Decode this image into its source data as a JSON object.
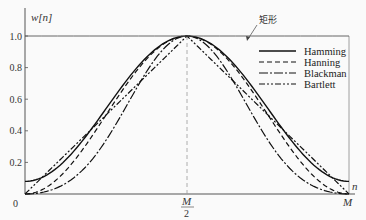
{
  "chart_data": {
    "type": "line",
    "title": "",
    "ylabel": "w[n]",
    "xlabel": "n",
    "ylim": [
      0,
      1.0
    ],
    "xlim": [
      0,
      "M"
    ],
    "yticks": [
      "0.2",
      "0.4",
      "0.6",
      "0.8",
      "1.0"
    ],
    "y_origin_label": "0",
    "xticks": [
      {
        "label_num": "M",
        "label_den": "2",
        "position": 0.5
      },
      {
        "label": "M",
        "position": 1.0
      }
    ],
    "grid": false,
    "legend_position": "upper right",
    "annotation": {
      "text": "矩形",
      "target": "rectangular window (horizontal line at 1.0)"
    },
    "x": [
      0,
      0.05,
      0.1,
      0.15,
      0.2,
      0.25,
      0.3,
      0.35,
      0.4,
      0.45,
      0.5,
      0.55,
      0.6,
      0.65,
      0.7,
      0.75,
      0.8,
      0.85,
      0.9,
      0.95,
      1.0
    ],
    "series": [
      {
        "name": "Hamming",
        "style": "solid",
        "values": [
          0.08,
          0.1,
          0.17,
          0.27,
          0.4,
          0.54,
          0.68,
          0.81,
          0.91,
          0.98,
          1.0,
          0.98,
          0.91,
          0.81,
          0.68,
          0.54,
          0.4,
          0.27,
          0.17,
          0.1,
          0.08
        ]
      },
      {
        "name": "Hanning",
        "style": "dashed",
        "values": [
          0.0,
          0.02,
          0.1,
          0.21,
          0.35,
          0.5,
          0.65,
          0.79,
          0.9,
          0.98,
          1.0,
          0.98,
          0.9,
          0.79,
          0.65,
          0.5,
          0.35,
          0.21,
          0.1,
          0.02,
          0.0
        ]
      },
      {
        "name": "Blackman",
        "style": "dash-dot",
        "values": [
          0.0,
          0.01,
          0.04,
          0.1,
          0.2,
          0.34,
          0.51,
          0.68,
          0.85,
          0.96,
          1.0,
          0.96,
          0.85,
          0.68,
          0.51,
          0.34,
          0.2,
          0.1,
          0.04,
          0.01,
          0.0
        ]
      },
      {
        "name": "Bartlett",
        "style": "dash-dot-dot",
        "values": [
          0.0,
          0.1,
          0.2,
          0.3,
          0.4,
          0.5,
          0.6,
          0.7,
          0.8,
          0.9,
          1.0,
          0.9,
          0.8,
          0.7,
          0.6,
          0.5,
          0.4,
          0.3,
          0.2,
          0.1,
          0.0
        ]
      },
      {
        "name": "矩形 (Rectangular)",
        "style": "solid-thin",
        "values": [
          1.0,
          1.0,
          1.0,
          1.0,
          1.0,
          1.0,
          1.0,
          1.0,
          1.0,
          1.0,
          1.0,
          1.0,
          1.0,
          1.0,
          1.0,
          1.0,
          1.0,
          1.0,
          1.0,
          1.0,
          1.0
        ]
      }
    ],
    "plot_px": {
      "x0": 25,
      "x1": 349,
      "y0": 194,
      "y1": 36
    }
  },
  "labels": {
    "y_axis": "w[n]",
    "x_axis": "n",
    "origin": "0",
    "m_half_num": "M",
    "m_half_den": "2",
    "m_end": "M",
    "annotation": "矩形",
    "legend": [
      "Hamming",
      "Hanning",
      "Blackman",
      "Bartlett"
    ]
  }
}
